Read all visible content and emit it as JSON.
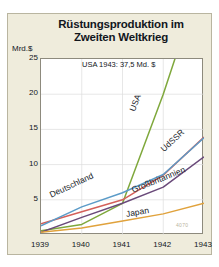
{
  "figure": {
    "title_line1": "Rüstungsproduktion im",
    "title_line2": "Zweiten Weltkrieg",
    "unit_label": "Mrd.$",
    "annotation": "USA 1943: 37,5 Md. $",
    "credit": "4070",
    "background_color": "#efecdc",
    "plot_background_color": "#ffffff"
  },
  "chart_data": {
    "type": "line",
    "title": "Rüstungsproduktion im Zweiten Weltkrieg",
    "xlabel": "",
    "ylabel": "Mrd.$",
    "x": [
      1939,
      1940,
      1941,
      1942,
      1943
    ],
    "xlim": [
      1939,
      1943
    ],
    "ylim": [
      0,
      25
    ],
    "yticks": [
      5,
      10,
      15,
      20,
      25
    ],
    "xticks": [
      1939,
      1940,
      1941,
      1942,
      1943
    ],
    "grid": true,
    "legend": "inline-labels",
    "annotations": [
      {
        "text": "USA 1943: 37,5 Md. $",
        "x": 1941.7,
        "y": 24.2
      }
    ],
    "series": [
      {
        "name": "USA",
        "color": "#7fa83c",
        "values": [
          0.6,
          1.5,
          4.5,
          20.0,
          37.5
        ],
        "label_x": 1941.25,
        "label_y": 17.5
      },
      {
        "name": "UdSSR",
        "color": "#d4605a",
        "values": [
          1.6,
          3.3,
          5.0,
          8.5,
          13.9
        ],
        "label_x": 1942.0,
        "label_y": 12.0
      },
      {
        "name": "Deutschland",
        "color": "#5b9bc8",
        "values": [
          1.3,
          4.0,
          6.0,
          8.6,
          13.8
        ],
        "label_x": 1939.25,
        "label_y": 5.6
      },
      {
        "name": "Großbritannien",
        "color": "#6a4a7a",
        "values": [
          0.4,
          2.5,
          4.5,
          6.8,
          11.1
        ],
        "label_x": 1941.25,
        "label_y": 6.2
      },
      {
        "name": "Japan",
        "color": "#e0a23c",
        "values": [
          0.4,
          1.0,
          2.0,
          3.0,
          4.5
        ],
        "label_x": 1941.1,
        "label_y": 2.9
      }
    ]
  },
  "y_axis": {
    "ticks": [
      {
        "label": "25",
        "value": 25
      },
      {
        "label": "20",
        "value": 20
      },
      {
        "label": "15",
        "value": 15
      },
      {
        "label": "10",
        "value": 10
      },
      {
        "label": "5",
        "value": 5
      }
    ]
  },
  "x_axis": {
    "ticks": [
      {
        "label": "1939",
        "value": 1939
      },
      {
        "label": "1940",
        "value": 1940
      },
      {
        "label": "1941",
        "value": 1941
      },
      {
        "label": "1942",
        "value": 1942
      },
      {
        "label": "1943",
        "value": 1943
      }
    ]
  }
}
